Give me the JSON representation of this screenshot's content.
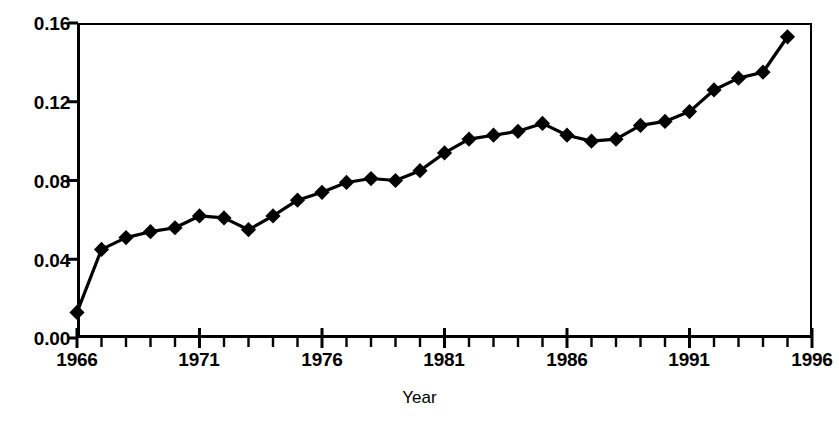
{
  "chart_data": {
    "type": "line",
    "title": "",
    "subtitle": "",
    "xlabel": "Year",
    "ylabel": "",
    "xlim": [
      1966,
      1996
    ],
    "ylim": [
      0.0,
      0.16
    ],
    "grid": false,
    "legend": null,
    "marker": "filled-diamond",
    "line_color": "#000000",
    "marker_color": "#000000",
    "x_tick_labels": [
      "1966",
      "1971",
      "1976",
      "1981",
      "1986",
      "1991",
      "1996"
    ],
    "x_tick_values": [
      1966,
      1971,
      1976,
      1981,
      1986,
      1991,
      1996
    ],
    "x_minor_tick_interval": 1,
    "y_tick_labels": [
      "0.00",
      "0.04",
      "0.08",
      "0.12",
      "0.16"
    ],
    "y_tick_values": [
      0.0,
      0.04,
      0.08,
      0.12,
      0.16
    ],
    "x": [
      1966,
      1967,
      1968,
      1969,
      1970,
      1971,
      1972,
      1973,
      1974,
      1975,
      1976,
      1977,
      1978,
      1979,
      1980,
      1981,
      1982,
      1983,
      1984,
      1985,
      1986,
      1987,
      1988,
      1989,
      1990,
      1991,
      1992,
      1993,
      1994,
      1995
    ],
    "values": [
      0.013,
      0.045,
      0.051,
      0.054,
      0.056,
      0.062,
      0.061,
      0.055,
      0.062,
      0.07,
      0.074,
      0.079,
      0.081,
      0.08,
      0.085,
      0.094,
      0.101,
      0.103,
      0.105,
      0.109,
      0.103,
      0.1,
      0.101,
      0.108,
      0.11,
      0.115,
      0.126,
      0.132,
      0.135,
      0.153
    ],
    "series": [
      {
        "name": "series-1",
        "x": [
          1966,
          1967,
          1968,
          1969,
          1970,
          1971,
          1972,
          1973,
          1974,
          1975,
          1976,
          1977,
          1978,
          1979,
          1980,
          1981,
          1982,
          1983,
          1984,
          1985,
          1986,
          1987,
          1988,
          1989,
          1990,
          1991,
          1992,
          1993,
          1994,
          1995
        ],
        "values": [
          0.013,
          0.045,
          0.051,
          0.054,
          0.056,
          0.062,
          0.061,
          0.055,
          0.062,
          0.07,
          0.074,
          0.079,
          0.081,
          0.08,
          0.085,
          0.094,
          0.101,
          0.103,
          0.105,
          0.109,
          0.103,
          0.1,
          0.101,
          0.108,
          0.11,
          0.115,
          0.126,
          0.132,
          0.135,
          0.153
        ]
      }
    ]
  },
  "axes": {
    "x_title": "Year",
    "y_labels": [
      "0.16",
      "0.12",
      "0.08",
      "0.04",
      "0.00"
    ],
    "x_labels": [
      "1966",
      "1971",
      "1976",
      "1981",
      "1986",
      "1991",
      "1996"
    ]
  }
}
